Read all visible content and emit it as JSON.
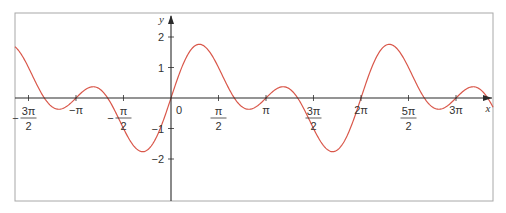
{
  "chart_data": {
    "type": "line",
    "title": "",
    "xlabel": "x",
    "ylabel": "y",
    "function": "y = sin(x) + sin(2x)",
    "xlim": [
      -5.16,
      10.65
    ],
    "ylim": [
      -3.4,
      2.8
    ],
    "grid": false,
    "legend": null,
    "x_ticks": [
      {
        "value": -4.712,
        "label_num": "3π",
        "label_den": "2",
        "sign": "−",
        "fraction": true
      },
      {
        "value": -3.1416,
        "label": "−π",
        "fraction": false
      },
      {
        "value": -1.5708,
        "label_num": "π",
        "label_den": "2",
        "sign": "−",
        "fraction": true
      },
      {
        "value": 0,
        "label": "0",
        "fraction": false
      },
      {
        "value": 1.5708,
        "label_num": "π",
        "label_den": "2",
        "sign": "",
        "fraction": true
      },
      {
        "value": 3.1416,
        "label": "π",
        "fraction": false
      },
      {
        "value": 4.712,
        "label_num": "3π",
        "label_den": "2",
        "sign": "",
        "fraction": true
      },
      {
        "value": 6.2832,
        "label": "2π",
        "fraction": false
      },
      {
        "value": 7.854,
        "label_num": "5π",
        "label_den": "2",
        "sign": "",
        "fraction": true
      },
      {
        "value": 9.4248,
        "label": "3π",
        "fraction": false
      }
    ],
    "y_ticks": [
      {
        "value": 2,
        "label": "2"
      },
      {
        "value": 1,
        "label": "1"
      },
      {
        "value": -1,
        "label": "−1"
      },
      {
        "value": -2,
        "label": "−2"
      }
    ],
    "series": [
      {
        "name": "sin x + sin 2x",
        "color": "#d9574a",
        "x": [
          -5.16,
          -4.71,
          -4.19,
          -3.67,
          -3.14,
          -2.62,
          -2.09,
          -1.57,
          -0.96,
          -0.52,
          0,
          0.52,
          0.96,
          1.57,
          2.09,
          2.62,
          3.14,
          3.67,
          4.19,
          4.71,
          5.32,
          5.76,
          6.28,
          6.8,
          7.24,
          7.85,
          8.38,
          8.9,
          9.42,
          9.95,
          10.47
        ],
        "values": [
          1.69,
          1.0,
          0.0,
          -0.37,
          0.0,
          0.37,
          0.0,
          -1.0,
          -1.76,
          -1.37,
          0.0,
          1.37,
          1.76,
          1.0,
          0.0,
          -0.37,
          0.0,
          0.37,
          0.0,
          -1.0,
          -1.76,
          -1.37,
          0.0,
          1.37,
          1.76,
          1.0,
          0.0,
          -0.37,
          0.0,
          0.37,
          0.0
        ]
      }
    ]
  },
  "layout": {
    "origin_px": [
      171,
      98
    ],
    "x_px_per_unit": 30.24,
    "y_px_per_unit": 30.5,
    "frame": {
      "left": 15,
      "top": 13,
      "right": 493,
      "bottom": 201
    },
    "colors": {
      "curve": "#d9574a",
      "axis": "#2a2a2a",
      "frame": "#a8a8a8",
      "text": "#333333"
    }
  }
}
